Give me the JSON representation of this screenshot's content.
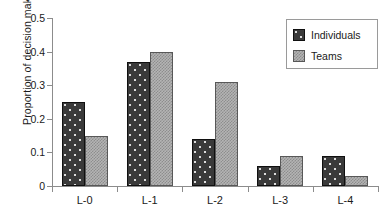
{
  "chart_data": {
    "type": "bar",
    "title": "",
    "subtitle": "",
    "xlabel": "",
    "ylabel": "Proportion of decision makers",
    "categories": [
      "L-0",
      "L-1",
      "L-2",
      "L-3",
      "L-4"
    ],
    "series": [
      {
        "name": "Individuals",
        "values": [
          0.25,
          0.37,
          0.14,
          0.06,
          0.09
        ],
        "color": "#3a3a3a",
        "pattern": "dark-with-light-dots"
      },
      {
        "name": "Teams",
        "values": [
          0.15,
          0.4,
          0.31,
          0.09,
          0.03
        ],
        "color": "#b4b4b4",
        "pattern": "light-checkered"
      }
    ],
    "ylim": [
      0,
      0.5
    ],
    "ytick_labels": [
      "0",
      "0.1",
      "0.2",
      "0.3",
      "0.4",
      "0.5"
    ],
    "ytick_values": [
      0,
      0.1,
      0.2,
      0.3,
      0.4,
      0.5
    ],
    "grid": false,
    "legend_position": "top-right",
    "legend_entries": [
      "Individuals",
      "Teams"
    ]
  },
  "axes": {
    "y_title": "Proportion of decision makers"
  },
  "legend": {
    "items": [
      {
        "label": "Individuals",
        "swatch": "dark-dotted-swatch-icon"
      },
      {
        "label": "Teams",
        "swatch": "light-checkered-swatch-icon"
      }
    ]
  }
}
